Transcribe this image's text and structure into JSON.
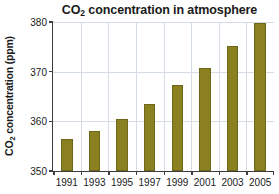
{
  "chart_data": {
    "type": "bar",
    "title": "CO2 concentration in atmosphere",
    "title_main": "CO",
    "title_sub": "2",
    "title_rest": " concentration in atmosphere",
    "xlabel": "",
    "ylabel": "CO2 concentration (ppm)",
    "ylabel_main": "CO",
    "ylabel_sub": "2",
    "ylabel_rest": " concentration (ppm)",
    "categories": [
      "1991",
      "1993",
      "1995",
      "1997",
      "1999",
      "2001",
      "2003",
      "2005"
    ],
    "values": [
      356.4,
      358.0,
      360.4,
      363.4,
      367.4,
      370.8,
      375.2,
      379.8
    ],
    "ylim": [
      350,
      380
    ],
    "yticks": [
      350,
      360,
      370,
      380
    ],
    "ytick_labels": [
      "350",
      "360",
      "370",
      "380"
    ],
    "grid": true,
    "grid_axis": "both",
    "legend": false,
    "bar_color": "#8a8020",
    "bar_edge_color": "#6e661a",
    "grid_color": "#d4dde6",
    "axis_color": "#3d3d3d",
    "background_color": "#ffffff",
    "text_color": "#1a1a1a"
  }
}
